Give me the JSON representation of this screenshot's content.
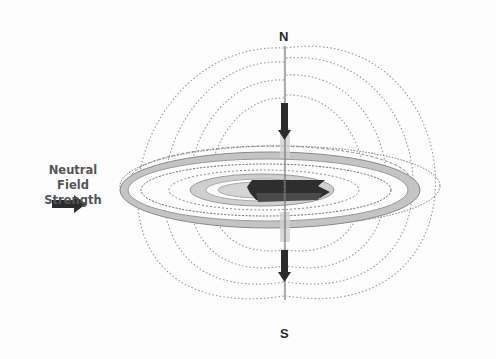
{
  "diagram": {
    "labels": {
      "north_pole": "N",
      "south_pole": "S",
      "side_label_line1": "Neutral",
      "side_label_line2": "Field",
      "side_label_line3": "Strength"
    },
    "elements": {
      "field_lines": "dotted arcs looping from N to S on both sides",
      "disk": "concentric elliptical rings (grey bands and dashed rings) around a dark central body",
      "axis": "vertical axis through center with downward arrows above and below disk",
      "side_arrow": "solid dark arrow pointing right toward the field"
    },
    "colors": {
      "field_line": "#9a9a9a",
      "ring_fill": "#c4c4c4",
      "core": "#2e2e2e",
      "arrow": "#2b2b2b",
      "text": "#2a2a2a"
    }
  }
}
